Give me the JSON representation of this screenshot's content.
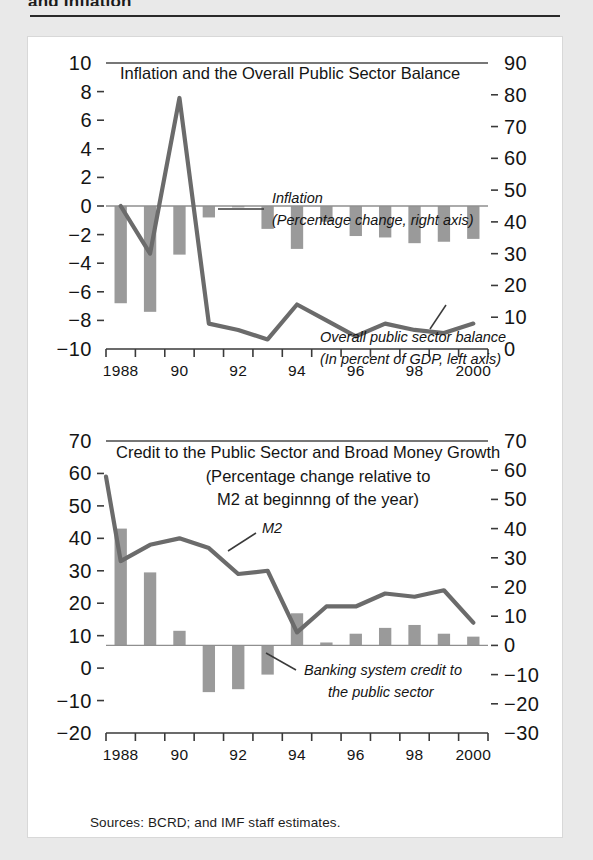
{
  "page": {
    "title": "and Inflation",
    "sources": "Sources: BCRD; and IMF staff estimates."
  },
  "chart_data": [
    {
      "id": "chart-inflation-balance",
      "type": "bar",
      "title": "Inflation and the Overall Public Sector Balance",
      "xlabel": "",
      "ylabel": "",
      "grid": false,
      "legend_position": "inline-annotation",
      "x": [
        1988,
        1989,
        1990,
        1991,
        1992,
        1993,
        1994,
        1995,
        1996,
        1997,
        1998,
        1999,
        2000
      ],
      "categories": [
        "1988",
        "1989",
        "1990",
        "1991",
        "1992",
        "1993",
        "1994",
        "1995",
        "1996",
        "1997",
        "1998",
        "1999",
        "2000"
      ],
      "xtick_labels": [
        "1988",
        "90",
        "92",
        "94",
        "96",
        "98",
        "2000"
      ],
      "xtick_values": [
        1988,
        1990,
        1992,
        1994,
        1996,
        1998,
        2000
      ],
      "left_axis": {
        "label": "Overall public sector balance (In percent of GDP, left axis)",
        "ylim": [
          -10,
          10
        ],
        "ticks": [
          10,
          8,
          6,
          4,
          2,
          0,
          -2,
          -4,
          -6,
          -8,
          -10
        ],
        "tick_labels": [
          "10",
          "8",
          "6",
          "4",
          "2",
          "0",
          "−2",
          "−4",
          "−6",
          "−8",
          "−10"
        ]
      },
      "right_axis": {
        "label": "Inflation (Percentage change, right axis)",
        "ylim": [
          0,
          90
        ],
        "ticks": [
          90,
          80,
          70,
          60,
          50,
          40,
          30,
          20,
          10,
          0
        ],
        "tick_labels": [
          "90",
          "80",
          "70",
          "60",
          "50",
          "40",
          "30",
          "20",
          "10",
          "0"
        ]
      },
      "series": [
        {
          "name": "Overall public sector balance",
          "chart_type": "bar",
          "axis": "left",
          "unit": "In percent of GDP",
          "values": [
            -6.8,
            -7.4,
            -3.4,
            -0.8,
            -0.1,
            -1.6,
            -3.0,
            -1.1,
            -2.1,
            -2.2,
            -2.6,
            -2.5,
            -2.3
          ]
        },
        {
          "name": "Inflation",
          "chart_type": "line",
          "axis": "right",
          "unit": "Percentage change",
          "values": [
            45,
            30,
            79,
            8,
            6,
            3,
            14,
            9,
            4,
            8,
            6,
            5,
            8
          ]
        }
      ],
      "annotations": [
        {
          "name": "inflation-annotation",
          "lines": [
            "Inflation",
            "(Percentage change, right axis)"
          ]
        },
        {
          "name": "balance-annotation",
          "lines": [
            "Overall  public sector balance",
            "(In percent of GDP, left axis)"
          ]
        }
      ]
    },
    {
      "id": "chart-credit-money",
      "type": "bar",
      "title": "Credit to the Public Sector and Broad Money Growth",
      "subtitle_lines": [
        "(Percentage change relative to",
        "M2 at beginnng of the year)"
      ],
      "xlabel": "",
      "ylabel": "",
      "grid": false,
      "legend_position": "inline-annotation",
      "x": [
        1988,
        1989,
        1990,
        1991,
        1992,
        1993,
        1994,
        1995,
        1996,
        1997,
        1998,
        1999,
        2000
      ],
      "categories": [
        "1988",
        "1989",
        "1990",
        "1991",
        "1992",
        "1993",
        "1994",
        "1995",
        "1996",
        "1997",
        "1998",
        "1999",
        "2000"
      ],
      "xtick_labels": [
        "1988",
        "90",
        "92",
        "94",
        "96",
        "98",
        "2000"
      ],
      "xtick_values": [
        1988,
        1990,
        1992,
        1994,
        1996,
        1998,
        2000
      ],
      "left_axis": {
        "ylim": [
          -20,
          70
        ],
        "ticks": [
          70,
          60,
          50,
          40,
          30,
          20,
          10,
          0,
          -10,
          -20
        ],
        "tick_labels": [
          "70",
          "60",
          "50",
          "40",
          "30",
          "20",
          "10",
          "0",
          "−10",
          "−20"
        ]
      },
      "right_axis": {
        "ylim": [
          -30,
          70
        ],
        "ticks": [
          70,
          60,
          50,
          40,
          30,
          20,
          10,
          0,
          -10,
          -20,
          -30
        ],
        "tick_labels": [
          "70",
          "60",
          "50",
          "40",
          "30",
          "20",
          "10",
          "0",
          "−10",
          "−20",
          "−30"
        ]
      },
      "series": [
        {
          "name": "M2",
          "chart_type": "line",
          "axis": "left",
          "values": [
            59,
            33,
            38,
            40,
            37,
            29,
            30,
            11,
            19,
            19,
            23,
            22,
            24,
            14
          ]
        },
        {
          "name": "Banking system credit to the public sector",
          "chart_type": "bar",
          "axis": "right",
          "values": [
            40,
            25,
            5,
            -16,
            -15,
            -10,
            11,
            1,
            4,
            6,
            7,
            4,
            3
          ]
        }
      ],
      "annotations": [
        {
          "name": "m2-annotation",
          "lines": [
            "M2"
          ]
        },
        {
          "name": "credit-annotation",
          "lines": [
            "Banking  system credit to",
            "the public sector"
          ]
        }
      ]
    }
  ],
  "colors": {
    "bar": "#9a9a9a",
    "line": "#6b6b6b",
    "text": "#141414",
    "page_background": "#e9e9e9",
    "panel_background": "#ffffff"
  }
}
